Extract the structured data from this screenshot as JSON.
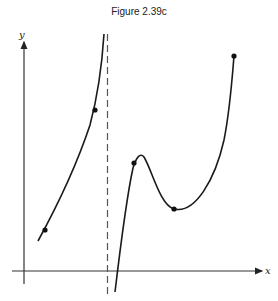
{
  "figure": {
    "title": "Figure 2.39c",
    "x_axis_label": "x",
    "y_axis_label": "y",
    "colors": {
      "curve": "#1a1a1a",
      "axis": "#333333",
      "asymptote": "#555555"
    }
  },
  "diagram": {
    "type": "function-graph",
    "vertical_asymptote": "dashed line left of the right branch",
    "marked_points": [
      "left branch lower point",
      "left branch upper point",
      "right branch point before local maximum",
      "local minimum",
      "right endpoint"
    ]
  }
}
